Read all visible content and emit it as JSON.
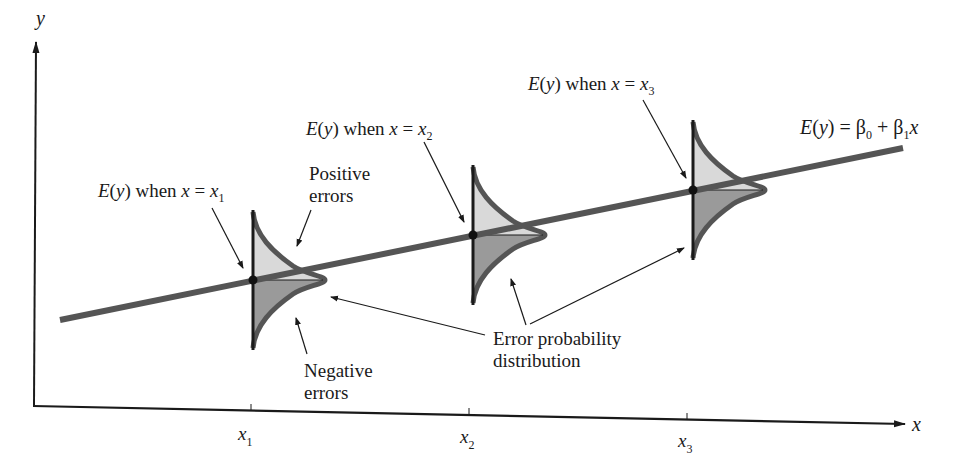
{
  "figure": {
    "axes": {
      "y_label": "y",
      "x_label": "x",
      "x_ticks": [
        {
          "base": "x",
          "sub": "1"
        },
        {
          "base": "x",
          "sub": "2"
        },
        {
          "base": "x",
          "sub": "3"
        }
      ]
    },
    "regression_line": {
      "label_prefix": "E(y) = ",
      "equation_parts": {
        "E": "E",
        "y": "y",
        "beta0": "β",
        "sub0": "0",
        "plus": " + ",
        "beta1": "β",
        "sub1": "1",
        "x": "x"
      }
    },
    "mean_labels": [
      {
        "prefix": "E",
        "y": "y",
        "mid": " when ",
        "x": "x",
        "eq": " = ",
        "base": "x",
        "sub": "1"
      },
      {
        "prefix": "E",
        "y": "y",
        "mid": " when ",
        "x": "x",
        "eq": " = ",
        "base": "x",
        "sub": "2"
      },
      {
        "prefix": "E",
        "y": "y",
        "mid": " when ",
        "x": "x",
        "eq": " = ",
        "base": "x",
        "sub": "3"
      }
    ],
    "annotations": {
      "positive_errors": [
        "Positive",
        "errors"
      ],
      "negative_errors": [
        "Negative",
        "errors"
      ],
      "error_distribution": [
        "Error probability",
        "distribution"
      ]
    },
    "colors": {
      "axis": "#1a1a1a",
      "regression_line": "#555555",
      "positive_fill": "#d9d9d9",
      "negative_fill": "#9a9a9a",
      "curve_outline": "#555555"
    }
  }
}
